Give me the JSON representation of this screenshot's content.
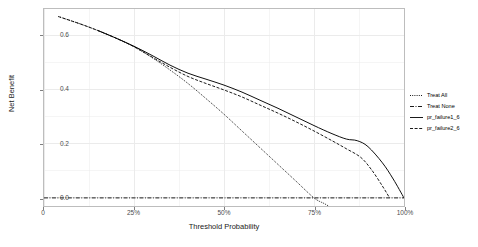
{
  "chart_data": {
    "type": "line",
    "title": "",
    "xlabel": "Threshold Probability",
    "ylabel": "Net Benefit",
    "xlim": [
      0,
      1.0
    ],
    "ylim": [
      -0.03,
      0.7
    ],
    "grid": true,
    "legend_position": "right",
    "x_ticks": [
      {
        "value": 0.0,
        "label": "0"
      },
      {
        "value": 0.25,
        "label": "25%"
      },
      {
        "value": 0.5,
        "label": "50%"
      },
      {
        "value": 0.75,
        "label": "75%"
      },
      {
        "value": 1.0,
        "label": "100%"
      }
    ],
    "y_ticks": [
      {
        "value": 0.0,
        "label": "0.0"
      },
      {
        "value": 0.2,
        "label": "0.2"
      },
      {
        "value": 0.4,
        "label": "0.4"
      },
      {
        "value": 0.6,
        "label": "0.6"
      }
    ],
    "series": [
      {
        "name": "Treat All",
        "style": "dotted",
        "color": "#000000",
        "x": [
          0.04,
          0.1,
          0.15,
          0.2,
          0.25,
          0.3,
          0.35,
          0.4,
          0.45,
          0.5,
          0.55,
          0.6,
          0.65,
          0.7,
          0.75,
          0.78,
          0.8
        ],
        "y": [
          0.672,
          0.645,
          0.62,
          0.592,
          0.56,
          0.52,
          0.474,
          0.424,
          0.368,
          0.31,
          0.248,
          0.186,
          0.124,
          0.062,
          0.0,
          -0.022,
          -0.038
        ]
      },
      {
        "name": "Treat None",
        "style": "dashdot",
        "color": "#000000",
        "x": [
          0.0,
          1.0
        ],
        "y": [
          0.0,
          0.0
        ]
      },
      {
        "name": "pr_failure1_6",
        "style": "solid",
        "color": "#000000",
        "x": [
          0.15,
          0.2,
          0.25,
          0.3,
          0.35,
          0.4,
          0.45,
          0.5,
          0.55,
          0.6,
          0.65,
          0.7,
          0.75,
          0.8,
          0.84,
          0.87,
          0.9,
          0.94,
          0.97,
          1.0
        ],
        "y": [
          0.62,
          0.592,
          0.562,
          0.528,
          0.492,
          0.462,
          0.44,
          0.418,
          0.392,
          0.362,
          0.332,
          0.3,
          0.268,
          0.238,
          0.218,
          0.212,
          0.19,
          0.13,
          0.07,
          0.0
        ]
      },
      {
        "name": "pr_failure2_6",
        "style": "dashed",
        "color": "#000000",
        "x": [
          0.04,
          0.1,
          0.15,
          0.2,
          0.25,
          0.3,
          0.35,
          0.4,
          0.45,
          0.5,
          0.55,
          0.6,
          0.65,
          0.7,
          0.75,
          0.8,
          0.84,
          0.88,
          0.91,
          0.94,
          0.96
        ],
        "y": [
          0.672,
          0.645,
          0.62,
          0.592,
          0.56,
          0.522,
          0.484,
          0.45,
          0.424,
          0.4,
          0.374,
          0.344,
          0.314,
          0.282,
          0.248,
          0.212,
          0.182,
          0.15,
          0.104,
          0.044,
          0.0
        ]
      }
    ]
  },
  "axes": {
    "y_title": "Net Benefit",
    "x_title": "Threshold Probability"
  },
  "legend": {
    "items": [
      {
        "label": "Treat All",
        "style": "dotted"
      },
      {
        "label": "Treat None",
        "style": "dashdot"
      },
      {
        "label": "pr_failure1_6",
        "style": "solid"
      },
      {
        "label": "pr_failure2_6",
        "style": "dashed"
      }
    ]
  },
  "caption": {
    "text": ""
  },
  "colors": {
    "panel_border": "#bdbdbd",
    "grid": "#ebebeb",
    "line": "#000000",
    "tick_text": "#4d4d4d"
  }
}
